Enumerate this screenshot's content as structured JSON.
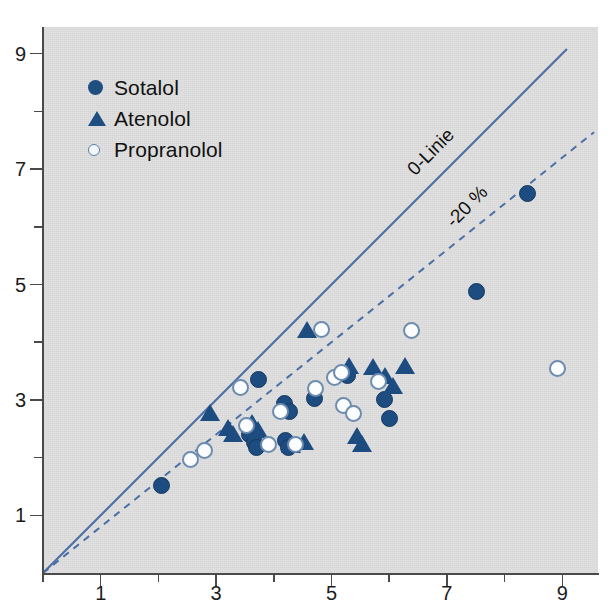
{
  "chart_data": {
    "type": "scatter",
    "title": "",
    "xlabel": "",
    "ylabel": "",
    "xlim": [
      0,
      9.6
    ],
    "ylim": [
      0,
      9.4
    ],
    "grid": false,
    "legend_position": "top-left",
    "background_color": "#dcdcdc",
    "marker_color": "#1d4c80",
    "line_color": "#4a6fa5",
    "x_ticks_major": [
      1,
      3,
      5,
      7,
      9
    ],
    "x_ticks_minor": [
      2,
      4,
      6,
      8
    ],
    "y_ticks_major": [
      1,
      3,
      5,
      7,
      9
    ],
    "y_ticks_minor": [
      2,
      4,
      6,
      8
    ],
    "x_tick_labels": [
      "1",
      "3",
      "5",
      "7",
      "9"
    ],
    "y_tick_labels": [
      "9",
      "7",
      "5",
      "3",
      "1"
    ],
    "annotations": [
      {
        "text": "0-Linie",
        "x": 7.0,
        "y": 7.0,
        "rotation": -45
      },
      {
        "text": "-20 %",
        "x": 7.6,
        "y": 6.1,
        "rotation": -45
      }
    ],
    "reference_lines": [
      {
        "name": "0-Linie",
        "style": "solid",
        "slope": 1.0,
        "intercept": 0,
        "color": "#4a6fa5"
      },
      {
        "name": "-20 %",
        "style": "dashed",
        "slope": 0.8,
        "intercept": 0,
        "color": "#4a6fa5"
      }
    ],
    "series": [
      {
        "name": "Sotalol",
        "marker": "filled-circle",
        "color": "#1d4c80",
        "points": [
          [
            2.06,
            1.51
          ],
          [
            3.58,
            2.4
          ],
          [
            3.66,
            2.26
          ],
          [
            3.7,
            2.17
          ],
          [
            3.74,
            3.35
          ],
          [
            4.18,
            2.93
          ],
          [
            4.28,
            2.8
          ],
          [
            4.2,
            2.3
          ],
          [
            4.26,
            2.17
          ],
          [
            4.7,
            3.02
          ],
          [
            5.28,
            3.42
          ],
          [
            5.92,
            3.0
          ],
          [
            6.0,
            2.68
          ],
          [
            7.52,
            4.88
          ],
          [
            8.4,
            6.58
          ]
        ]
      },
      {
        "name": "Atenolol",
        "marker": "triangle",
        "color": "#1d4c80",
        "points": [
          [
            2.9,
            2.79
          ],
          [
            3.2,
            2.53
          ],
          [
            3.3,
            2.41
          ],
          [
            3.62,
            2.6
          ],
          [
            3.72,
            2.48
          ],
          [
            4.3,
            2.22
          ],
          [
            4.52,
            2.28
          ],
          [
            4.58,
            4.22
          ],
          [
            5.3,
            3.6
          ],
          [
            5.44,
            2.38
          ],
          [
            5.52,
            2.24
          ],
          [
            5.72,
            3.58
          ],
          [
            5.92,
            3.42
          ],
          [
            6.06,
            3.25
          ],
          [
            6.28,
            3.6
          ]
        ]
      },
      {
        "name": "Propranolol",
        "marker": "open-circle",
        "color": "#6d8cb0",
        "points": [
          [
            2.55,
            1.96
          ],
          [
            2.8,
            2.13
          ],
          [
            3.42,
            3.22
          ],
          [
            3.52,
            2.55
          ],
          [
            3.9,
            2.22
          ],
          [
            4.12,
            2.8
          ],
          [
            4.38,
            2.22
          ],
          [
            4.72,
            3.2
          ],
          [
            4.82,
            4.22
          ],
          [
            5.06,
            3.38
          ],
          [
            5.18,
            3.48
          ],
          [
            5.2,
            2.9
          ],
          [
            5.38,
            2.76
          ],
          [
            5.82,
            3.32
          ],
          [
            6.38,
            4.2
          ],
          [
            8.92,
            3.55
          ]
        ]
      }
    ]
  },
  "legend": {
    "items": [
      {
        "label": "Sotalol",
        "marker": "filled-circle"
      },
      {
        "label": "Atenolol",
        "marker": "triangle"
      },
      {
        "label": "Propranolol",
        "marker": "open-circle"
      }
    ]
  }
}
